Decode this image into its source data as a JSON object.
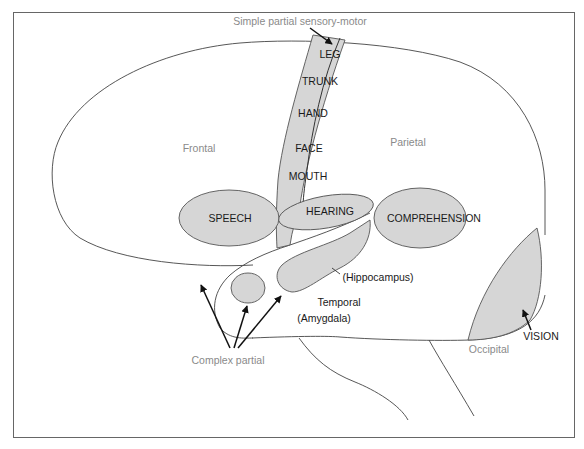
{
  "diagram": {
    "title": "Simple partial sensory-motor",
    "lobes": {
      "frontal": "Frontal",
      "parietal": "Parietal",
      "temporal": "Temporal",
      "occipital": "Occipital"
    },
    "motor_strip": {
      "items": [
        "LEG",
        "TRUNK",
        "HAND",
        "FACE",
        "MOUTH"
      ]
    },
    "areas": {
      "speech": "SPEECH",
      "hearing": "HEARING",
      "comprehension": "COMPREHENSION",
      "vision": "VISION"
    },
    "structures": {
      "hippocampus": "(Hippocampus)",
      "amygdala": "(Amygdala)"
    },
    "annotations": {
      "complex_partial": "Complex partial"
    },
    "colors": {
      "region_fill": "#d6d6d6",
      "outline": "#444444",
      "label_dark": "#1a1a1a",
      "label_gray": "#8a8a8a",
      "frame": "#666666"
    }
  }
}
